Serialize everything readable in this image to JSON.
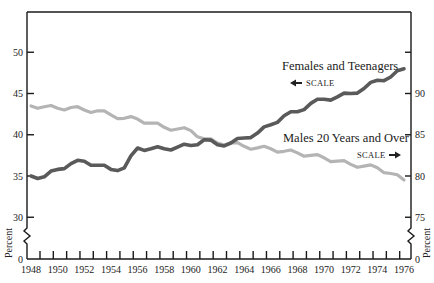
{
  "chart_data": {
    "type": "line",
    "title": "",
    "xlabel": "",
    "ylabel_left": "Percent",
    "ylabel_right": "Percent",
    "x": [
      1948,
      1949,
      1950,
      1951,
      1952,
      1953,
      1954,
      1955,
      1956,
      1957,
      1958,
      1959,
      1960,
      1961,
      1962,
      1963,
      1964,
      1965,
      1966,
      1967,
      1968,
      1969,
      1970,
      1971,
      1972,
      1973,
      1974,
      1975,
      1976
    ],
    "x_tick_labels": [
      "1948",
      "1950",
      "1952",
      "1954",
      "1956",
      "1958",
      "1960",
      "1962",
      "1964",
      "1966",
      "1968",
      "1970",
      "1972",
      "1974",
      "1976"
    ],
    "left_axis": {
      "ticks": [
        0,
        30,
        35,
        40,
        45,
        50
      ],
      "tick_labels": [
        "0",
        "30",
        "35",
        "40",
        "45",
        "50"
      ],
      "ylim": [
        30,
        55
      ],
      "broken": true
    },
    "right_axis": {
      "ticks": [
        0,
        75,
        80,
        85,
        90,
        95
      ],
      "tick_labels": [
        "0",
        "75",
        "80",
        "85",
        "90",
        ""
      ],
      "ylim": [
        75,
        100
      ],
      "broken": true
    },
    "series": [
      {
        "name": "Females and Teenagers",
        "axis": "left",
        "scale_note": "SCALE",
        "scale_direction": "left",
        "color": "#5a5a5a",
        "values": [
          35.0,
          34.9,
          35.8,
          36.5,
          36.8,
          36.3,
          35.8,
          36.0,
          38.4,
          38.3,
          38.3,
          38.5,
          38.7,
          39.4,
          38.8,
          39.0,
          39.6,
          40.2,
          41.2,
          42.3,
          42.8,
          43.8,
          44.3,
          44.6,
          45.0,
          45.6,
          46.6,
          47.0,
          48.0
        ]
      },
      {
        "name": "Males 20 Years and Over",
        "axis": "right",
        "scale_note": "SCALE",
        "scale_direction": "right",
        "color": "#b4b4b4",
        "values": [
          88.5,
          88.4,
          88.2,
          88.3,
          88.0,
          87.9,
          87.4,
          87.0,
          86.9,
          86.4,
          85.9,
          85.7,
          85.5,
          84.5,
          84.0,
          84.0,
          83.6,
          83.4,
          83.3,
          83.0,
          82.8,
          82.5,
          82.2,
          81.8,
          81.4,
          81.2,
          81.0,
          80.3,
          79.5
        ]
      }
    ],
    "grid": false,
    "legend": "inline annotations"
  }
}
